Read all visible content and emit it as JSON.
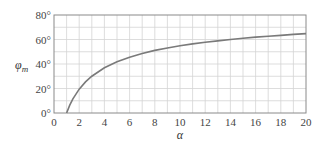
{
  "chart_data": {
    "type": "line",
    "title": "",
    "xlabel": "α",
    "ylabel": "φm",
    "ylabel_main": "φ",
    "ylabel_sub": "m",
    "xlim": [
      0,
      20
    ],
    "ylim": [
      0,
      80
    ],
    "grid": true,
    "x_ticks": [
      0,
      2,
      4,
      6,
      8,
      10,
      12,
      14,
      16,
      18,
      20
    ],
    "x_tick_labels": [
      "0",
      "2",
      "4",
      "6",
      "8",
      "10",
      "12",
      "14",
      "16",
      "18",
      "20"
    ],
    "y_ticks": [
      0,
      20,
      40,
      60,
      80
    ],
    "y_tick_labels": [
      "0°",
      "20°",
      "40°",
      "60°",
      "80°"
    ],
    "series": [
      {
        "name": "φm",
        "color": "#7a7a7a",
        "x": [
          1,
          1.25,
          1.5,
          2,
          2.5,
          3,
          4,
          5,
          6,
          7,
          8,
          9,
          10,
          11,
          12,
          13,
          14,
          15,
          16,
          17,
          18,
          19,
          20
        ],
        "y": [
          0,
          6.4,
          11.5,
          19.5,
          25.4,
          30.0,
          36.9,
          41.8,
          45.6,
          48.6,
          51.1,
          53.1,
          54.9,
          56.4,
          57.8,
          58.9,
          60.0,
          61.0,
          61.9,
          62.7,
          63.4,
          64.2,
          64.8
        ]
      }
    ]
  }
}
